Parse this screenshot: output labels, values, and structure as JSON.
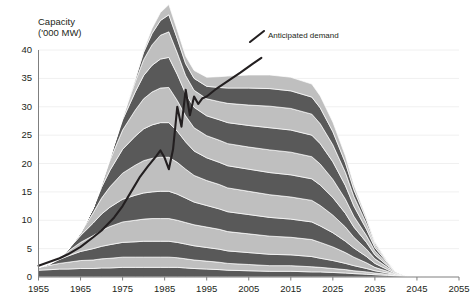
{
  "chart_data": {
    "type": "area",
    "title": "",
    "ylabel": "Capacity\n('000 MW)",
    "ylabel_line1": "Capacity",
    "ylabel_line2": "('000 MW)",
    "xlabel": "",
    "ylim": [
      0,
      40
    ],
    "xlim": [
      1955,
      2055
    ],
    "yticks": [
      0,
      5,
      10,
      15,
      20,
      25,
      30,
      35,
      40
    ],
    "ytick_labels": [
      "0",
      "5",
      "10",
      "15",
      "20",
      "25",
      "30",
      "35",
      "40"
    ],
    "xticks": [
      1955,
      1965,
      1975,
      1985,
      1995,
      2005,
      2015,
      2025,
      2035,
      2045,
      2055
    ],
    "xtick_labels": [
      "1955",
      "1965",
      "1975",
      "1985",
      "1995",
      "2005",
      "2015",
      "2025",
      "2035",
      "2045",
      "2055"
    ],
    "grid": true,
    "grid_axis": "y",
    "legend_position": "none",
    "stacking": "stacked-bands",
    "x": [
      1955,
      1958,
      1960,
      1962,
      1965,
      1968,
      1970,
      1972,
      1975,
      1978,
      1980,
      1982,
      1984,
      1986,
      1988,
      1990,
      1992,
      1995,
      1998,
      2000,
      2005,
      2010,
      2015,
      2020,
      2022,
      2025,
      2028,
      2030,
      2033,
      2035,
      2038,
      2040,
      2043,
      2045,
      2048,
      2050,
      2055
    ],
    "series": [
      {
        "name": "band-1",
        "shade": "dark",
        "values": [
          1.2,
          1.3,
          1.4,
          1.4,
          1.5,
          1.5,
          1.6,
          1.6,
          1.7,
          1.7,
          1.7,
          1.7,
          1.7,
          1.7,
          1.7,
          1.6,
          1.5,
          1.4,
          1.3,
          1.2,
          1.1,
          1.0,
          1.0,
          0.9,
          0.9,
          0.8,
          0.7,
          0.6,
          0.5,
          0.4,
          0.3,
          0.2,
          0.1,
          0.05,
          0.0,
          0.0,
          0.0
        ]
      },
      {
        "name": "band-2",
        "shade": "light",
        "values": [
          0.5,
          0.8,
          1.0,
          1.2,
          1.4,
          1.5,
          1.6,
          1.7,
          1.8,
          1.8,
          1.8,
          1.8,
          1.8,
          1.8,
          1.7,
          1.6,
          1.5,
          1.4,
          1.3,
          1.2,
          1.1,
          1.0,
          1.0,
          0.9,
          0.8,
          0.7,
          0.6,
          0.5,
          0.4,
          0.3,
          0.2,
          0.1,
          0.05,
          0.0,
          0.0,
          0.0,
          0.0
        ]
      },
      {
        "name": "band-3",
        "shade": "dark",
        "values": [
          0.0,
          0.3,
          0.7,
          1.1,
          1.6,
          2.0,
          2.2,
          2.4,
          2.6,
          2.7,
          2.8,
          2.8,
          2.8,
          2.8,
          2.7,
          2.6,
          2.5,
          2.4,
          2.3,
          2.2,
          2.1,
          2.0,
          1.9,
          1.8,
          1.6,
          1.4,
          1.1,
          0.9,
          0.6,
          0.4,
          0.2,
          0.1,
          0.0,
          0.0,
          0.0,
          0.0,
          0.0
        ]
      },
      {
        "name": "band-4",
        "shade": "light",
        "values": [
          0.0,
          0.0,
          0.3,
          0.8,
          1.6,
          2.3,
          2.8,
          3.2,
          3.6,
          3.8,
          3.9,
          4.0,
          4.0,
          4.0,
          3.9,
          3.8,
          3.7,
          3.6,
          3.5,
          3.4,
          3.3,
          3.2,
          3.1,
          3.0,
          2.8,
          2.4,
          1.9,
          1.5,
          1.0,
          0.6,
          0.3,
          0.1,
          0.0,
          0.0,
          0.0,
          0.0,
          0.0
        ]
      },
      {
        "name": "band-5",
        "shade": "dark",
        "values": [
          0.0,
          0.0,
          0.0,
          0.3,
          1.2,
          2.2,
          2.9,
          3.4,
          4.0,
          4.4,
          4.6,
          4.7,
          4.8,
          4.8,
          4.6,
          4.3,
          4.0,
          3.8,
          3.6,
          3.5,
          3.4,
          3.3,
          3.2,
          3.1,
          2.9,
          2.5,
          2.0,
          1.6,
          1.1,
          0.7,
          0.3,
          0.1,
          0.0,
          0.0,
          0.0,
          0.0,
          0.0
        ]
      },
      {
        "name": "band-6",
        "shade": "light",
        "values": [
          0.0,
          0.0,
          0.0,
          0.0,
          0.5,
          1.8,
          2.8,
          3.6,
          4.6,
          5.3,
          5.7,
          5.9,
          6.0,
          6.0,
          5.6,
          5.1,
          4.7,
          4.4,
          4.3,
          4.2,
          4.1,
          4.0,
          3.9,
          3.8,
          3.6,
          3.1,
          2.5,
          1.9,
          1.3,
          0.8,
          0.4,
          0.2,
          0.0,
          0.0,
          0.0,
          0.0,
          0.0
        ]
      },
      {
        "name": "band-7",
        "shade": "dark",
        "values": [
          0.0,
          0.0,
          0.0,
          0.0,
          0.0,
          0.8,
          1.9,
          2.9,
          4.2,
          5.1,
          5.6,
          5.9,
          6.1,
          6.1,
          5.5,
          4.8,
          4.3,
          4.0,
          3.9,
          3.9,
          3.9,
          3.9,
          3.9,
          3.8,
          3.6,
          3.1,
          2.4,
          1.8,
          1.2,
          0.7,
          0.3,
          0.1,
          0.0,
          0.0,
          0.0,
          0.0,
          0.0
        ]
      },
      {
        "name": "band-8",
        "shade": "light",
        "values": [
          0.0,
          0.0,
          0.0,
          0.0,
          0.0,
          0.0,
          0.6,
          1.8,
          3.4,
          4.6,
          5.3,
          5.8,
          6.1,
          6.2,
          5.4,
          4.6,
          4.1,
          3.9,
          3.9,
          3.9,
          3.9,
          4.0,
          4.0,
          3.9,
          3.7,
          3.2,
          2.5,
          1.9,
          1.2,
          0.7,
          0.3,
          0.1,
          0.0,
          0.0,
          0.0,
          0.0,
          0.0
        ]
      },
      {
        "name": "band-9",
        "shade": "dark",
        "values": [
          0.0,
          0.0,
          0.0,
          0.0,
          0.0,
          0.0,
          0.0,
          0.4,
          1.8,
          3.2,
          4.1,
          4.7,
          5.1,
          5.3,
          4.6,
          3.9,
          3.6,
          3.5,
          3.6,
          3.7,
          3.8,
          3.9,
          3.9,
          3.8,
          3.6,
          3.1,
          2.4,
          1.8,
          1.1,
          0.6,
          0.2,
          0.0,
          0.0,
          0.0,
          0.0,
          0.0,
          0.0
        ]
      },
      {
        "name": "band-10",
        "shade": "light",
        "values": [
          0.0,
          0.0,
          0.0,
          0.0,
          0.0,
          0.0,
          0.0,
          0.0,
          0.4,
          1.8,
          2.8,
          3.6,
          4.2,
          4.5,
          3.8,
          3.2,
          3.0,
          3.0,
          3.2,
          3.4,
          3.6,
          3.8,
          3.8,
          3.7,
          3.5,
          3.0,
          2.3,
          1.7,
          1.0,
          0.5,
          0.2,
          0.0,
          0.0,
          0.0,
          0.0,
          0.0,
          0.0
        ]
      },
      {
        "name": "band-11",
        "shade": "dark",
        "values": [
          0.0,
          0.0,
          0.0,
          0.0,
          0.0,
          0.0,
          0.0,
          0.0,
          0.0,
          0.5,
          1.3,
          2.0,
          2.6,
          3.0,
          2.5,
          2.1,
          2.1,
          2.2,
          2.5,
          2.7,
          3.0,
          3.1,
          3.1,
          3.0,
          2.8,
          2.3,
          1.7,
          1.2,
          0.7,
          0.3,
          0.1,
          0.0,
          0.0,
          0.0,
          0.0,
          0.0,
          0.0
        ]
      },
      {
        "name": "band-12",
        "shade": "light",
        "values": [
          0.0,
          0.0,
          0.0,
          0.0,
          0.0,
          0.0,
          0.0,
          0.0,
          0.0,
          0.0,
          0.3,
          0.9,
          1.4,
          1.8,
          1.5,
          1.3,
          1.4,
          1.6,
          1.9,
          2.1,
          2.3,
          2.4,
          2.4,
          2.3,
          2.1,
          1.7,
          1.2,
          0.8,
          0.4,
          0.2,
          0.0,
          0.0,
          0.0,
          0.0,
          0.0,
          0.0,
          0.0
        ]
      }
    ],
    "annotations": [
      {
        "name": "anticipated-demand",
        "label": "Anticipated demand",
        "label_x": 2010,
        "label_y": 38.8
      }
    ],
    "demand_line": {
      "name": "Anticipated demand",
      "color": "#231f20",
      "x": [
        1955,
        1960,
        1962,
        1965,
        1968,
        1970,
        1973,
        1975,
        1977,
        1979,
        1981,
        1983,
        1984,
        1985,
        1986,
        1987,
        1988,
        1989,
        1990,
        1991,
        1992,
        1993,
        1994,
        1995,
        1997,
        2000,
        2003,
        2006,
        2008
      ],
      "y": [
        2.0,
        3.3,
        4.0,
        5.3,
        7.0,
        8.2,
        10.5,
        12.5,
        15.0,
        17.5,
        19.5,
        21.3,
        22.3,
        21.0,
        19.0,
        22.5,
        30.0,
        26.5,
        33.0,
        28.5,
        31.8,
        30.5,
        31.5,
        31.8,
        33.0,
        34.5,
        36.0,
        37.6,
        38.6
      ]
    }
  },
  "colors": {
    "dark_band": "#595959",
    "light_band": "#bfbfbf",
    "band_edge": "#ffffff",
    "line": "#231f20",
    "axis": "#7f7f7f",
    "grid": "#f0f0f0",
    "text": "#231f20",
    "background": "#ffffff"
  }
}
